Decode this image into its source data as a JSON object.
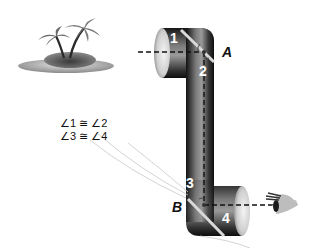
{
  "diagram": {
    "points": {
      "A": "A",
      "B": "B"
    },
    "angle_numbers": {
      "a1": "1",
      "a2": "2",
      "a3": "3",
      "a4": "4"
    },
    "statements": [
      "∠1 ≅ ∠2",
      "∠3 ≅ ∠4"
    ],
    "objects": {
      "island": "island-with-palm-trees",
      "periscope": "periscope-tube",
      "eye": "viewer-eye"
    },
    "colors": {
      "tube_dark": "#1a1a1a",
      "tube_mid": "#6e6e6e",
      "tube_light": "#cfcfcf",
      "mirror": "#d9d9d9",
      "line": "#111111",
      "background": "#ffffff"
    }
  }
}
